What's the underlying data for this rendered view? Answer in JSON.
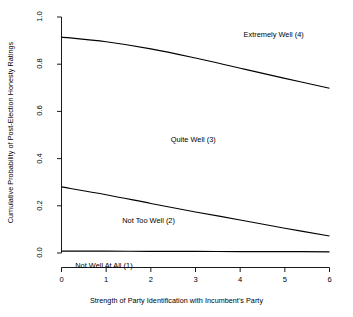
{
  "chart_data": {
    "type": "line",
    "title": "",
    "subtitle": "",
    "xlabel": "Strength of Party Identification with Incumbent's Party",
    "ylabel": "Cumulative Probability of Post-Election Honesty Ratings",
    "xlim": [
      0,
      6
    ],
    "ylim": [
      0,
      1
    ],
    "xticks": [
      "0",
      "1",
      "2",
      "3",
      "4",
      "5",
      "6"
    ],
    "xtick_values": [
      0,
      1,
      2,
      3,
      4,
      5,
      6
    ],
    "yticks": [
      "0.0",
      "0.2",
      "0.4",
      "0.6",
      "0.8",
      "1.0"
    ],
    "ytick_values": [
      0.0,
      0.2,
      0.4,
      0.6,
      0.8,
      1.0
    ],
    "grid": false,
    "legend_position": "inline-annotations",
    "x": [
      0,
      1,
      2,
      3,
      4,
      5,
      6
    ],
    "series": [
      {
        "name": "Extremely Well (4)",
        "values": [
          0.915,
          0.895,
          0.865,
          0.826,
          0.783,
          0.74,
          0.698
        ]
      },
      {
        "name": "Quite Well (3)",
        "values": [
          0.28,
          0.247,
          0.21,
          0.174,
          0.14,
          0.105,
          0.072
        ]
      },
      {
        "name": "Not Well At All (1)",
        "values": [
          0.008,
          0.008,
          0.007,
          0.007,
          0.006,
          0.006,
          0.005
        ]
      }
    ],
    "annotations": [
      {
        "text": "Extremely Well (4)",
        "x": 4.75,
        "y": 0.925
      },
      {
        "text": "Quite Well (3)",
        "x": 2.95,
        "y": 0.48
      },
      {
        "text": "Not Too Well (2)",
        "x": 1.95,
        "y": 0.135
      },
      {
        "text": "Not Well At All (1)",
        "x": 0.95,
        "y": -0.055
      }
    ]
  },
  "colors": {
    "axis": "#000000",
    "line": "#000000",
    "background": "#ffffff",
    "text": "#000000"
  }
}
